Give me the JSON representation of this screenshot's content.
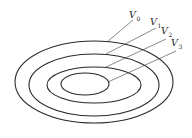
{
  "diagram": {
    "stroke_color": "#2a2a2a",
    "ellipses": [
      {
        "name": "V0",
        "cx": 94,
        "cy": 82,
        "rx": 79,
        "ry": 41
      },
      {
        "name": "V1",
        "cx": 94,
        "cy": 85,
        "rx": 65,
        "ry": 31
      },
      {
        "name": "V2",
        "cx": 94,
        "cy": 85,
        "rx": 47,
        "ry": 18
      },
      {
        "name": "V3",
        "cx": 85,
        "cy": 84,
        "rx": 24,
        "ry": 11
      }
    ],
    "labels": [
      {
        "main": "V",
        "sub": "0",
        "x": 129,
        "y": 18,
        "line": [
          107,
          42,
          133,
          20
        ]
      },
      {
        "main": "V",
        "sub": "1",
        "x": 150,
        "y": 25,
        "line": [
          106,
          54,
          156,
          28
        ]
      },
      {
        "main": "V",
        "sub": "2",
        "x": 161,
        "y": 34,
        "line": [
          106,
          67,
          166,
          39
        ]
      },
      {
        "main": "V",
        "sub": "3",
        "x": 171,
        "y": 46,
        "line": [
          108,
          82,
          176,
          51
        ]
      }
    ]
  }
}
